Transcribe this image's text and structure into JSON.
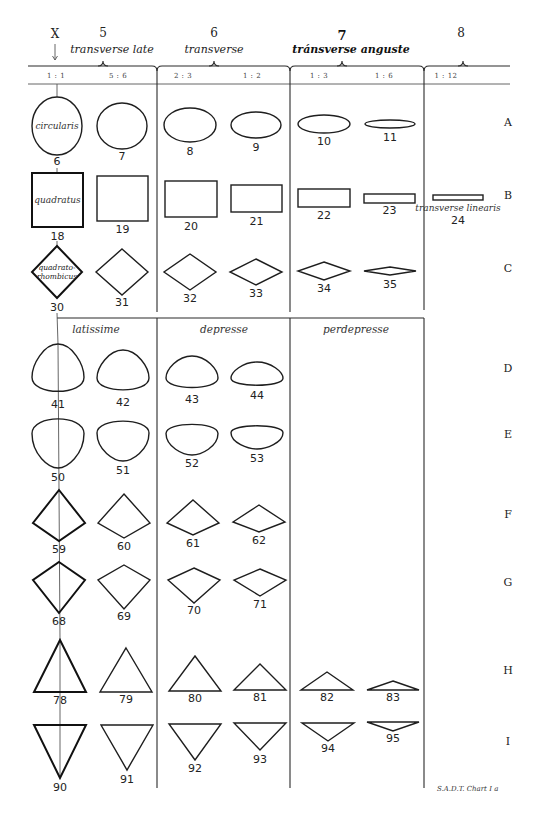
{
  "title_marker": {
    "label": "X",
    "arrow": "down-arrow-icon"
  },
  "column_groups": [
    {
      "number": "5",
      "label": "transverse late",
      "bold": false,
      "num_x": 103,
      "label_x": 112,
      "brace_x": 103
    },
    {
      "number": "6",
      "label": "transverse",
      "bold": false,
      "num_x": 214,
      "label_x": 214,
      "brace_x": 214
    },
    {
      "number": "7",
      "label": "tránsverse anguste",
      "bold": true,
      "num_x": 342,
      "label_x": 351,
      "brace_x": 342
    },
    {
      "number": "8",
      "label": "",
      "bold": false,
      "num_x": 461,
      "label_x": 461,
      "brace_x": 463
    }
  ],
  "ratios": [
    {
      "label": "1 : 1",
      "x": 56
    },
    {
      "label": "5 : 6",
      "x": 118
    },
    {
      "label": "2 : 3",
      "x": 183
    },
    {
      "label": "1 : 2",
      "x": 252
    },
    {
      "label": "1 : 3",
      "x": 319
    },
    {
      "label": "1 : 6",
      "x": 384
    },
    {
      "label": "1 : 12",
      "x": 446
    }
  ],
  "sub_groups": [
    {
      "label": "latissime",
      "x": 96
    },
    {
      "label": "depresse",
      "x": 224
    },
    {
      "label": "perdepresse",
      "x": 356
    }
  ],
  "row_labels": [
    {
      "label": "A",
      "y": 126
    },
    {
      "label": "B",
      "y": 199
    },
    {
      "label": "C",
      "y": 272
    },
    {
      "label": "D",
      "y": 372
    },
    {
      "label": "E",
      "y": 438
    },
    {
      "label": "F",
      "y": 518
    },
    {
      "label": "G",
      "y": 586
    },
    {
      "label": "H",
      "y": 674
    },
    {
      "label": "I",
      "y": 745
    }
  ],
  "shapes": [
    {
      "id": "6",
      "kind": "ellipse",
      "cx": 57,
      "cy": 126,
      "rx": 25,
      "ry": 29,
      "bold": false,
      "label_y": 165,
      "inner": "circularis"
    },
    {
      "id": "7",
      "kind": "ellipse",
      "cx": 122,
      "cy": 126,
      "rx": 25,
      "ry": 23,
      "label_y": 160
    },
    {
      "id": "8",
      "kind": "ellipse",
      "cx": 190,
      "cy": 125,
      "rx": 26,
      "ry": 17,
      "label_y": 155
    },
    {
      "id": "9",
      "kind": "ellipse",
      "cx": 256,
      "cy": 125,
      "rx": 25,
      "ry": 13,
      "label_y": 151
    },
    {
      "id": "10",
      "kind": "ellipse",
      "cx": 324,
      "cy": 124,
      "rx": 26,
      "ry": 9,
      "label_y": 145
    },
    {
      "id": "11",
      "kind": "ellipse",
      "cx": 390,
      "cy": 124,
      "rx": 25,
      "ry": 4,
      "label_y": 141
    },
    {
      "id": "18",
      "kind": "rect",
      "x": 32,
      "y": 173,
      "w": 51,
      "h": 54,
      "bold": true,
      "label_y": 240,
      "inner": "quadratus"
    },
    {
      "id": "19",
      "kind": "rect",
      "x": 97,
      "y": 176,
      "w": 51,
      "h": 45,
      "label_y": 233
    },
    {
      "id": "20",
      "kind": "rect",
      "x": 165,
      "y": 181,
      "w": 52,
      "h": 36,
      "label_y": 230
    },
    {
      "id": "21",
      "kind": "rect",
      "x": 231,
      "y": 185,
      "w": 51,
      "h": 27,
      "label_y": 225
    },
    {
      "id": "22",
      "kind": "rect",
      "x": 298,
      "y": 189,
      "w": 52,
      "h": 18,
      "label_y": 219
    },
    {
      "id": "23",
      "kind": "rect",
      "x": 364,
      "y": 194,
      "w": 51,
      "h": 9,
      "label_y": 214
    },
    {
      "id": "24",
      "kind": "rect",
      "x": 433,
      "y": 195,
      "w": 50,
      "h": 5,
      "label_y": 224,
      "caption": "transverse linearis"
    },
    {
      "id": "30",
      "kind": "diamond",
      "cx": 57,
      "cy": 272,
      "hw": 25,
      "hh": 26,
      "bold": true,
      "label_y": 311,
      "inner1": "quadrato-",
      "inner2": "rhombicus"
    },
    {
      "id": "31",
      "kind": "diamond",
      "cx": 122,
      "cy": 272,
      "hw": 26,
      "hh": 23,
      "label_y": 306
    },
    {
      "id": "32",
      "kind": "diamond",
      "cx": 190,
      "cy": 272,
      "hw": 26,
      "hh": 18,
      "label_y": 302
    },
    {
      "id": "33",
      "kind": "diamond",
      "cx": 256,
      "cy": 272,
      "hw": 26,
      "hh": 13,
      "label_y": 297
    },
    {
      "id": "34",
      "kind": "diamond",
      "cx": 324,
      "cy": 271,
      "hw": 26,
      "hh": 9,
      "label_y": 292
    },
    {
      "id": "35",
      "kind": "diamond",
      "cx": 390,
      "cy": 271,
      "hw": 26,
      "hh": 4,
      "label_y": 288
    },
    {
      "id": "41",
      "kind": "egg",
      "cx": 58,
      "top": 344,
      "bot": 395,
      "hw": 26,
      "shape": "tall",
      "label_y": 408
    },
    {
      "id": "42",
      "kind": "egg",
      "cx": 123,
      "top": 350,
      "bot": 393,
      "hw": 26,
      "shape": "round",
      "label_y": 406
    },
    {
      "id": "43",
      "kind": "egg",
      "cx": 192,
      "top": 356,
      "bot": 390,
      "hw": 26,
      "shape": "dome",
      "label_y": 403
    },
    {
      "id": "44",
      "kind": "egg",
      "cx": 257,
      "top": 362,
      "bot": 387,
      "hw": 26,
      "shape": "dome",
      "label_y": 399
    },
    {
      "id": "50",
      "kind": "egg",
      "cx": 58,
      "top": 415,
      "bot": 468,
      "hw": 26,
      "shape": "inv-tall",
      "label_y": 481
    },
    {
      "id": "51",
      "kind": "egg",
      "cx": 123,
      "top": 418,
      "bot": 461,
      "hw": 26,
      "shape": "inv-round",
      "label_y": 474
    },
    {
      "id": "52",
      "kind": "egg",
      "cx": 192,
      "top": 422,
      "bot": 455,
      "hw": 26,
      "shape": "inv-dome",
      "label_y": 467
    },
    {
      "id": "53",
      "kind": "egg",
      "cx": 257,
      "top": 424,
      "bot": 449,
      "hw": 26,
      "shape": "inv-dome",
      "label_y": 462
    },
    {
      "id": "59",
      "kind": "kite",
      "cx": 59,
      "top": 490,
      "mid": 523,
      "bot": 541,
      "hw": 26,
      "bold": true,
      "label_y": 553
    },
    {
      "id": "60",
      "kind": "kite",
      "cx": 124,
      "top": 494,
      "mid": 523,
      "bot": 538,
      "hw": 26,
      "label_y": 550
    },
    {
      "id": "61",
      "kind": "kite",
      "cx": 193,
      "top": 500,
      "mid": 523,
      "bot": 535,
      "hw": 26,
      "label_y": 547
    },
    {
      "id": "62",
      "kind": "kite",
      "cx": 259,
      "top": 505,
      "mid": 522,
      "bot": 532,
      "hw": 26,
      "label_y": 544
    },
    {
      "id": "68",
      "kind": "kite",
      "cx": 59,
      "top": 562,
      "mid": 580,
      "bot": 613,
      "hw": 26,
      "bold": true,
      "label_y": 625
    },
    {
      "id": "69",
      "kind": "kite",
      "cx": 124,
      "top": 565,
      "mid": 580,
      "bot": 609,
      "hw": 26,
      "label_y": 620
    },
    {
      "id": "70",
      "kind": "kite",
      "cx": 194,
      "top": 568,
      "mid": 580,
      "bot": 603,
      "hw": 26,
      "label_y": 614
    },
    {
      "id": "71",
      "kind": "kite",
      "cx": 260,
      "top": 569,
      "mid": 580,
      "bot": 596,
      "hw": 26,
      "label_y": 608
    },
    {
      "id": "78",
      "kind": "tri-up",
      "cx": 60,
      "top": 640,
      "base": 692,
      "hw": 26,
      "bold": true,
      "label_y": 704
    },
    {
      "id": "79",
      "kind": "tri-up",
      "cx": 126,
      "top": 648,
      "base": 692,
      "hw": 26,
      "label_y": 703
    },
    {
      "id": "80",
      "kind": "tri-up",
      "cx": 195,
      "top": 656,
      "base": 691,
      "hw": 26,
      "label_y": 702
    },
    {
      "id": "81",
      "kind": "tri-up",
      "cx": 260,
      "top": 664,
      "base": 690,
      "hw": 26,
      "label_y": 701
    },
    {
      "id": "82",
      "kind": "tri-up",
      "cx": 327,
      "top": 672,
      "base": 690,
      "hw": 26,
      "label_y": 701
    },
    {
      "id": "83",
      "kind": "tri-up",
      "cx": 393,
      "top": 681,
      "base": 690,
      "hw": 26,
      "label_y": 701
    },
    {
      "id": "90",
      "kind": "tri-down",
      "cx": 60,
      "base": 725,
      "bot": 778,
      "hw": 26,
      "bold": true,
      "label_y": 791
    },
    {
      "id": "91",
      "kind": "tri-down",
      "cx": 127,
      "base": 725,
      "bot": 770,
      "hw": 26,
      "label_y": 783
    },
    {
      "id": "92",
      "kind": "tri-down",
      "cx": 195,
      "base": 724,
      "bot": 760,
      "hw": 26,
      "label_y": 772
    },
    {
      "id": "93",
      "kind": "tri-down",
      "cx": 260,
      "base": 723,
      "bot": 750,
      "hw": 26,
      "label_y": 763
    },
    {
      "id": "94",
      "kind": "tri-down",
      "cx": 328,
      "base": 723,
      "bot": 741,
      "hw": 26,
      "label_y": 752
    },
    {
      "id": "95",
      "kind": "tri-down",
      "cx": 393,
      "base": 722,
      "bot": 731,
      "hw": 26,
      "label_y": 742
    }
  ],
  "footer": "S.A.D.T. Chart I a"
}
